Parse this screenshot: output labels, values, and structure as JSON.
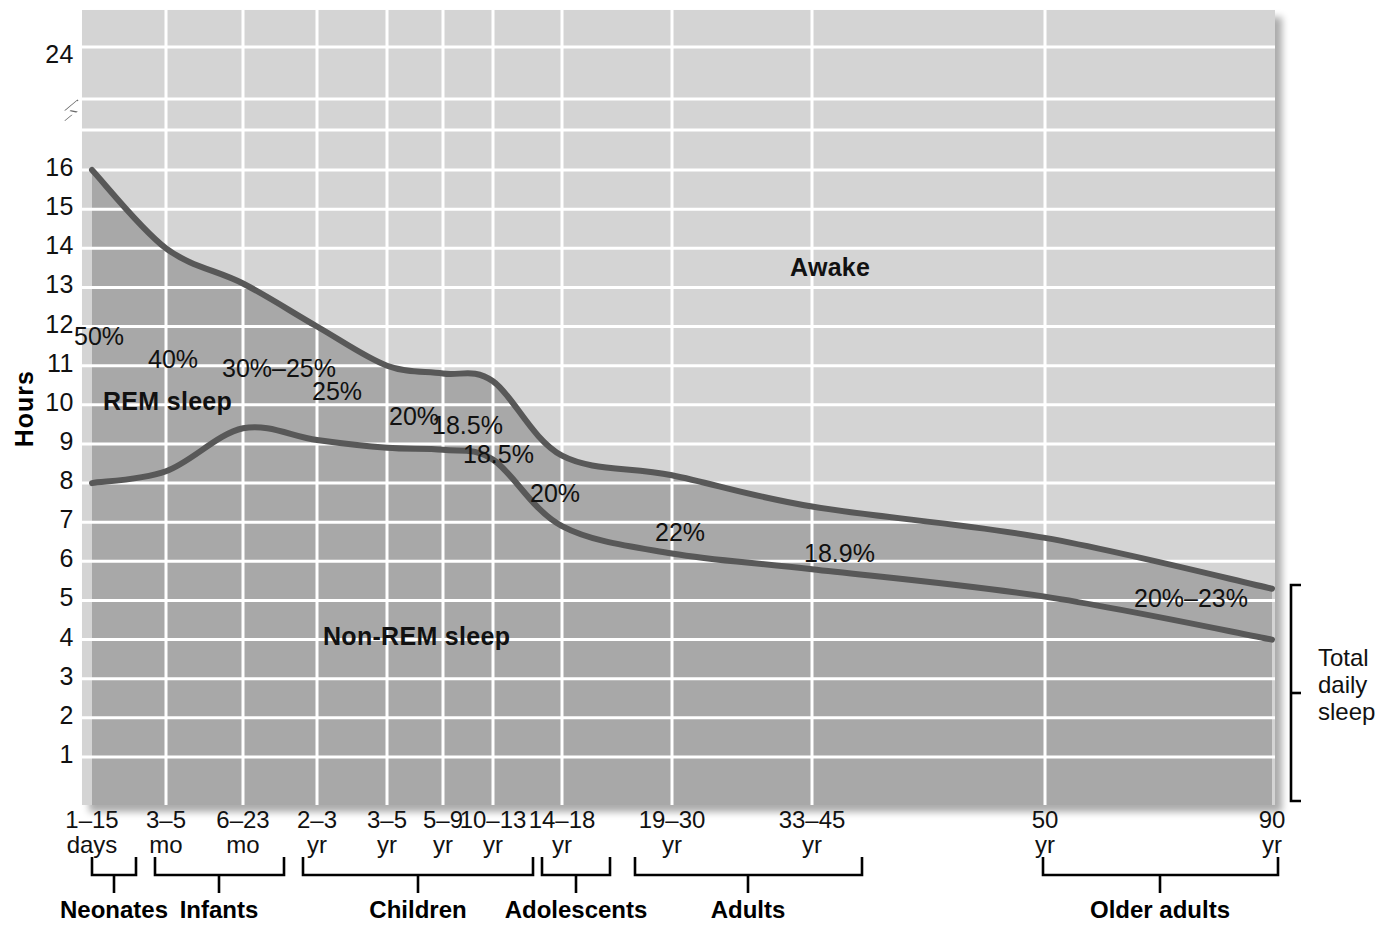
{
  "chart_data": {
    "type": "area",
    "title": "",
    "xlabel": "",
    "ylabel": "Hours",
    "ylim": [
      0,
      16
    ],
    "y_axis_break": true,
    "y_ticks": [
      "24",
      "16",
      "15",
      "14",
      "13",
      "12",
      "11",
      "10",
      "9",
      "8",
      "7",
      "6",
      "5",
      "4",
      "3",
      "2",
      "1"
    ],
    "grid": true,
    "legend_position": "in-plot",
    "x_categories": [
      {
        "line1": "1–15",
        "line2": "days"
      },
      {
        "line1": "3–5",
        "line2": "mo"
      },
      {
        "line1": "6–23",
        "line2": "mo"
      },
      {
        "line1": "2–3",
        "line2": "yr"
      },
      {
        "line1": "3–5",
        "line2": "yr"
      },
      {
        "line1": "5–9",
        "line2": "yr"
      },
      {
        "line1": "10–13",
        "line2": "yr"
      },
      {
        "line1": "14–18",
        "line2": "yr"
      },
      {
        "line1": "19–30",
        "line2": "yr"
      },
      {
        "line1": "33–45",
        "line2": "yr"
      },
      {
        "line1": "50",
        "line2": "yr"
      },
      {
        "line1": "90",
        "line2": "yr"
      }
    ],
    "series": [
      {
        "name": "Total daily sleep",
        "description": "Upper boundary: total sleep hours (top of REM band)",
        "values": [
          16.0,
          14.0,
          13.1,
          12.0,
          11.0,
          10.8,
          10.6,
          8.7,
          8.2,
          7.4,
          6.6,
          5.3
        ]
      },
      {
        "name": "Non-REM sleep",
        "description": "Lower boundary: non-REM sleep hours (top of Non-REM band)",
        "values": [
          8.0,
          8.3,
          9.4,
          9.1,
          8.9,
          8.85,
          8.6,
          6.9,
          6.2,
          5.8,
          5.1,
          4.0
        ]
      }
    ],
    "bands": [
      {
        "name": "Awake",
        "fill": "#d4d4d4"
      },
      {
        "name": "REM sleep",
        "fill": "#a8a8a8"
      },
      {
        "name": "Non-REM sleep",
        "fill": "#a8a8a8"
      }
    ],
    "annotations": [
      {
        "text": "Awake",
        "bold": true,
        "x": 790,
        "y": 253
      },
      {
        "text": "REM sleep",
        "bold": true,
        "x": 103,
        "y": 387
      },
      {
        "text": "Non-REM sleep",
        "bold": true,
        "x": 323,
        "y": 622
      },
      {
        "text": "50%",
        "bold": false,
        "x": 74,
        "y": 322
      },
      {
        "text": "40%",
        "bold": false,
        "x": 148,
        "y": 345
      },
      {
        "text": "30%–25%",
        "bold": false,
        "x": 222,
        "y": 354
      },
      {
        "text": "25%",
        "bold": false,
        "x": 312,
        "y": 377
      },
      {
        "text": "20%",
        "bold": false,
        "x": 389,
        "y": 402
      },
      {
        "text": "18.5%",
        "bold": false,
        "x": 432,
        "y": 411
      },
      {
        "text": "18.5%",
        "bold": false,
        "x": 463,
        "y": 440
      },
      {
        "text": "20%",
        "bold": false,
        "x": 530,
        "y": 479
      },
      {
        "text": "22%",
        "bold": false,
        "x": 655,
        "y": 518
      },
      {
        "text": "18.9%",
        "bold": false,
        "x": 804,
        "y": 539
      },
      {
        "text": "20%–23%",
        "bold": false,
        "x": 1134,
        "y": 584
      }
    ]
  },
  "axis": {
    "y_title": "Hours"
  },
  "groups": [
    {
      "label": "Neonates",
      "start_px": 92,
      "end_px": 136,
      "center_px": 114
    },
    {
      "label": "Infants",
      "start_px": 155,
      "end_px": 284,
      "center_px": 219
    },
    {
      "label": "Children",
      "start_px": 303,
      "end_px": 533,
      "center_px": 418
    },
    {
      "label": "Adolescents",
      "start_px": 542,
      "end_px": 610,
      "center_px": 576
    },
    {
      "label": "Adults",
      "start_px": 635,
      "end_px": 862,
      "center_px": 748
    },
    {
      "label": "Older adults",
      "start_px": 1043,
      "end_px": 1278,
      "center_px": 1160
    }
  ],
  "right_bracket": {
    "label_line1": "Total",
    "label_line2": "daily",
    "label_line3": "sleep"
  },
  "colors": {
    "awake_fill": "#d4d4d4",
    "sleep_fill": "#a8a8a8",
    "curve": "#585858",
    "gridline": "#ffffff",
    "text": "#111111"
  }
}
